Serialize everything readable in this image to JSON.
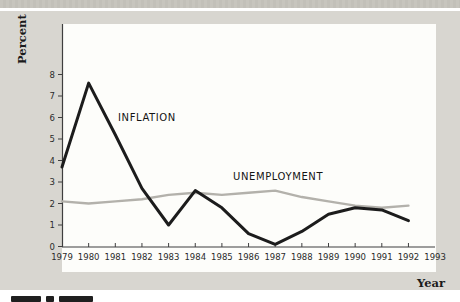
{
  "figure": {
    "percent_axis_title": "Percent",
    "year_axis_title": "Year",
    "clipped_caption_visible": true
  },
  "colors": {
    "panel_gray": "#d8d6d0",
    "top_strip_gray": "#c5c3bc",
    "plot_background": "#fdfdfa",
    "axis_color": "#3f3f3f",
    "inflation_line": "#1c1c1c",
    "unemployment_line": "#b3b1ab"
  },
  "chart_data": {
    "type": "line",
    "title": "",
    "xlabel": "Year",
    "ylabel": "Percent",
    "x": [
      1979,
      1980,
      1981,
      1982,
      1983,
      1984,
      1985,
      1986,
      1987,
      1988,
      1989,
      1990,
      1991,
      1992
    ],
    "x_tick_labels": [
      "1979",
      "1980",
      "1981",
      "1982",
      "1983",
      "1984",
      "1985",
      "1986",
      "1987",
      "1988",
      "1989",
      "1990",
      "1991",
      "1992",
      "1993"
    ],
    "y_ticks": [
      "0",
      "1",
      "2",
      "3",
      "4",
      "5",
      "6",
      "7",
      "8"
    ],
    "ylim": [
      0,
      8
    ],
    "grid": false,
    "legend_position": "inline-labels",
    "series": [
      {
        "name": "INFLATION",
        "color": "#1c1c1c",
        "values": [
          3.7,
          7.6,
          5.2,
          2.7,
          1.0,
          2.6,
          1.8,
          0.6,
          0.1,
          0.7,
          1.5,
          1.8,
          1.7,
          1.2
        ]
      },
      {
        "name": "UNEMPLOYMENT",
        "color": "#b3b1ab",
        "values": [
          2.1,
          2.0,
          2.1,
          2.2,
          2.4,
          2.5,
          2.4,
          2.5,
          2.6,
          2.3,
          2.1,
          1.9,
          1.8,
          1.9
        ]
      }
    ]
  }
}
